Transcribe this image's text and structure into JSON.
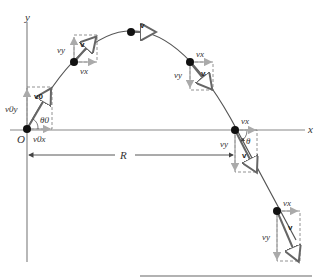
{
  "axes": {
    "x_label": "x",
    "y_label": "y",
    "origin_label": "O"
  },
  "range": {
    "label": "R"
  },
  "colors": {
    "trajectory": "#555555",
    "velocity_vector": "#666666",
    "component_arrow": "#aaaaaa",
    "ball": "#111111",
    "dashed_box": "#777777"
  },
  "points": [
    {
      "name": "launch",
      "velocity_label": "v0",
      "vx_label": "v0x",
      "vy_label": "v0y",
      "angle_label": "θ0"
    },
    {
      "name": "rising",
      "velocity_label": "v",
      "vx_label": "vx",
      "vy_label": "vy"
    },
    {
      "name": "apex",
      "velocity_label": "v"
    },
    {
      "name": "falling",
      "velocity_label": "v",
      "vx_label": "vx",
      "vy_label": "vy"
    },
    {
      "name": "landing",
      "velocity_label": "v",
      "vx_label": "vx",
      "vy_label": "vy",
      "angle_label": "θ"
    },
    {
      "name": "below-axis",
      "velocity_label": "v",
      "vx_label": "vx",
      "vy_label": "vy"
    }
  ]
}
